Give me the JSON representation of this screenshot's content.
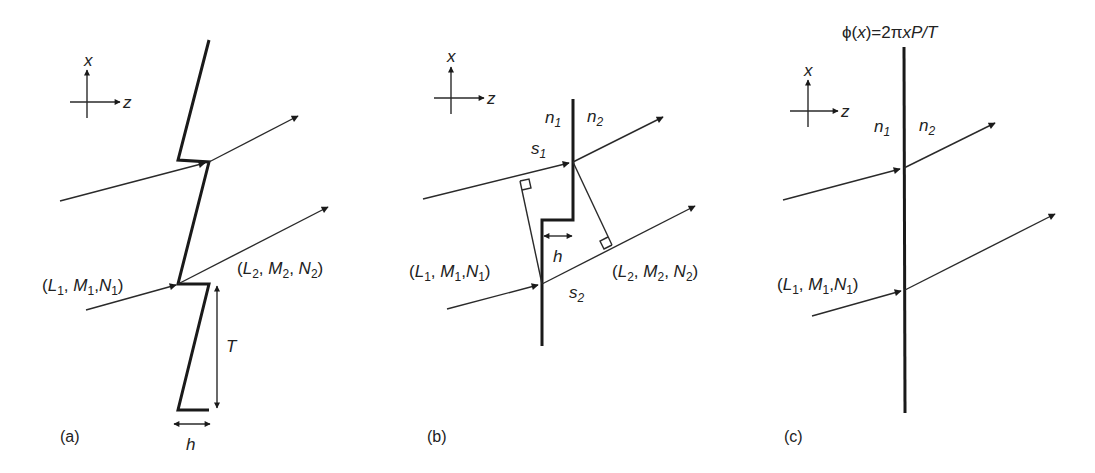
{
  "figure": {
    "panels": [
      {
        "id": "a",
        "caption": "(a)",
        "axes": {
          "x_label": "x",
          "z_label": "z"
        },
        "incident_label": {
          "open": "(",
          "L": "L",
          "L_sub": "1",
          "M": "M",
          "M_sub": "1",
          "N": "N",
          "N_sub": "1",
          "close": ")"
        },
        "refracted_label": {
          "open": "(",
          "L": "L",
          "L_sub": "2",
          "M": "M",
          "M_sub": "2",
          "N": "N",
          "N_sub": "2",
          "close": ")"
        },
        "period_label": "T",
        "step_label": "h",
        "description": "sawtooth (blazed) surface with period T and step height h"
      },
      {
        "id": "b",
        "caption": "(b)",
        "axes": {
          "x_label": "x",
          "z_label": "z"
        },
        "medium_left": {
          "n": "n",
          "sub": "1"
        },
        "medium_right": {
          "n": "n",
          "sub": "2"
        },
        "path_upper": {
          "s": "s",
          "sub": "1"
        },
        "path_lower": {
          "s": "s",
          "sub": "2"
        },
        "incident_label": {
          "open": "(",
          "L": "L",
          "L_sub": "1",
          "M": "M",
          "M_sub": "1",
          "N": "N",
          "N_sub": "1",
          "close": ")"
        },
        "refracted_label": {
          "open": "(",
          "L": "L",
          "L_sub": "2",
          "M": "M",
          "M_sub": "2",
          "N": "N",
          "N_sub": "2",
          "close": ")"
        },
        "step_label": "h",
        "description": "stepped interface with optical path lengths s1, s2"
      },
      {
        "id": "c",
        "caption": "(c)",
        "axes": {
          "x_label": "x",
          "z_label": "z"
        },
        "phase_equation": "ϕ(x)=2πxP/T",
        "phase_parts": {
          "phi": "ϕ(",
          "x1": "x",
          "eq": ")=2π",
          "x2": "x",
          "P": "P",
          "slash": "/",
          "T": "T"
        },
        "medium_left": {
          "n": "n",
          "sub": "1"
        },
        "medium_right": {
          "n": "n",
          "sub": "2"
        },
        "incident_label": {
          "open": "(",
          "L": "L",
          "L_sub": "1",
          "M": "M",
          "M_sub": "1",
          "N": "N",
          "N_sub": "1",
          "close": ")"
        },
        "description": "thin planar interface with linear phase function"
      }
    ],
    "colors": {
      "ink": "#1a1a1a",
      "background": "#ffffff"
    }
  }
}
